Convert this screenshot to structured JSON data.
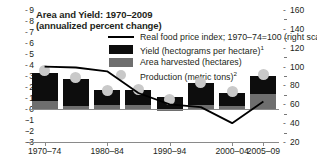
{
  "chart_data": {
    "type": "bar",
    "title": "Area and Yield: 1970–2009",
    "subtitle": "(annualized percent change)",
    "xlabel": "",
    "ylabel": "",
    "grid": false,
    "legend_position": "top-center",
    "left_axis": {
      "ylim": [
        -3,
        9
      ],
      "ticks": [
        9,
        8,
        7,
        6,
        5,
        4,
        3,
        2,
        1,
        0,
        -1,
        -2,
        -3
      ],
      "tick_labels": [
        "9",
        "8",
        "7",
        "6",
        "5",
        "4",
        "3",
        "2",
        "1",
        "0",
        "-1",
        "-2",
        "-3"
      ]
    },
    "right_axis": {
      "ylim": [
        20,
        160
      ],
      "ticks": [
        160,
        140,
        120,
        100,
        80,
        60,
        40,
        20
      ],
      "tick_labels": [
        "160",
        "140",
        "120",
        "100",
        "80",
        "60",
        "40",
        "20"
      ],
      "minor_ticks": [
        150,
        130,
        110,
        90,
        70,
        50,
        30
      ]
    },
    "categories": [
      "1970–74",
      "1975–79",
      "1980–84",
      "1985–89",
      "1990–94",
      "1995–99",
      "2000–04",
      "2005–09"
    ],
    "x_tick_labels": [
      "1970–74",
      "1980–84",
      "1990–94",
      "2000–04",
      "2005–09"
    ],
    "series": [
      {
        "name": "Yield (hectograms per hectare)",
        "footnote": "1",
        "type": "bar-stack-top",
        "color": "#0d0d0d",
        "values": [
          2.6,
          2.45,
          1.35,
          1.3,
          1.1,
          1.95,
          1.2,
          1.6
        ]
      },
      {
        "name": "Area harvested (hectares)",
        "footnote": "",
        "type": "bar-stack-bottom",
        "color": "#6e6e6e",
        "values": [
          0.7,
          0.25,
          0.35,
          0.4,
          -0.2,
          0.4,
          0.3,
          1.4
        ]
      },
      {
        "name": "Production (metric tons)",
        "footnote": "2",
        "type": "scatter",
        "color": "#c9c9c9",
        "values": [
          3.5,
          2.85,
          1.7,
          1.75,
          0.85,
          2.4,
          1.6,
          3.15
        ]
      },
      {
        "name": "Real food price index; 1970–74=100 (right scale)",
        "footnote": "",
        "type": "line",
        "color": "#000000",
        "axis": "right",
        "values": [
          100,
          99,
          95,
          72,
          60,
          57,
          40,
          63
        ]
      }
    ],
    "legend_entries": [
      {
        "key": "line",
        "label": "Real food price index; 1970–74=100 (right scale)",
        "sup": ""
      },
      {
        "key": "swatch-black",
        "label": "Yield (hectograms per hectare)",
        "sup": "1"
      },
      {
        "key": "swatch-gray",
        "label": "Area harvested (hectares)",
        "sup": ""
      },
      {
        "key": "dot",
        "label": "Production (metric tons)",
        "sup": "2"
      }
    ]
  }
}
